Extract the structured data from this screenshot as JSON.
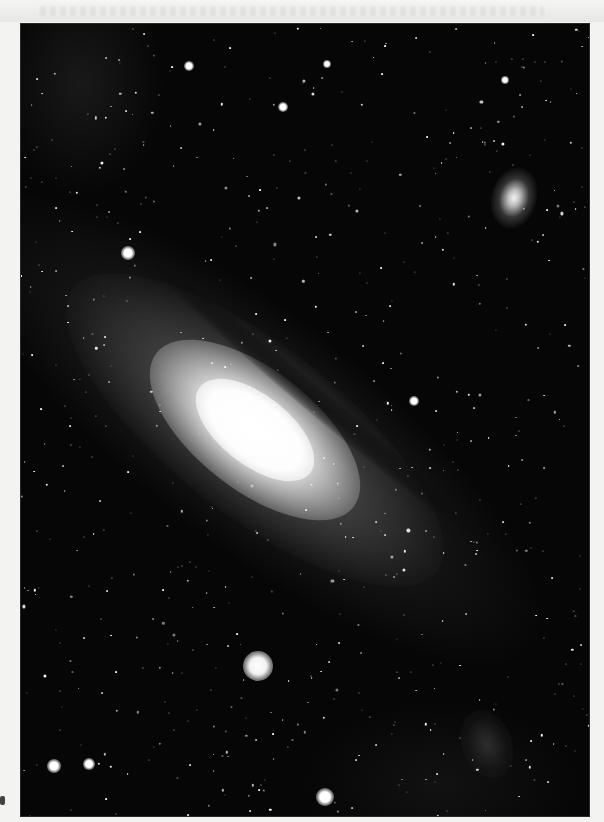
{
  "image": {
    "subject": "Andromeda galaxy photograph",
    "description": "Black-and-white scanned photograph of the Andromeda galaxy (M31) with satellite galaxies, on a light paper margin",
    "colors": {
      "paper": "#f3f3f1",
      "sky": "#060606",
      "core": "#ffffff",
      "halo": "#8a8a8a"
    },
    "frame": {
      "left": 21,
      "top": 24,
      "width": 568,
      "height": 792
    },
    "galaxy": {
      "center_x": 234,
      "center_y": 406,
      "angle_deg": 38
    },
    "satellites": [
      {
        "name": "upper-right-satellite-galaxy",
        "x": 493,
        "y": 174,
        "kind": "m110"
      },
      {
        "name": "lower-left-satellite-galaxy",
        "x": 237,
        "y": 642,
        "kind": "m32"
      }
    ],
    "nebula_patches": [
      {
        "x": 466,
        "y": 720,
        "w": 50,
        "h": 70
      }
    ],
    "bright_stars": [
      {
        "x": 107,
        "y": 229,
        "r": 7
      },
      {
        "x": 304,
        "y": 773,
        "r": 9
      },
      {
        "x": 33,
        "y": 742,
        "r": 7
      },
      {
        "x": 68,
        "y": 740,
        "r": 6
      },
      {
        "x": 393,
        "y": 377,
        "r": 5
      },
      {
        "x": 168,
        "y": 42,
        "r": 5
      },
      {
        "x": 306,
        "y": 40,
        "r": 4
      },
      {
        "x": 262,
        "y": 83,
        "r": 5
      },
      {
        "x": 484,
        "y": 56,
        "r": 4
      }
    ],
    "star_seed": 1931,
    "star_count": 620
  }
}
